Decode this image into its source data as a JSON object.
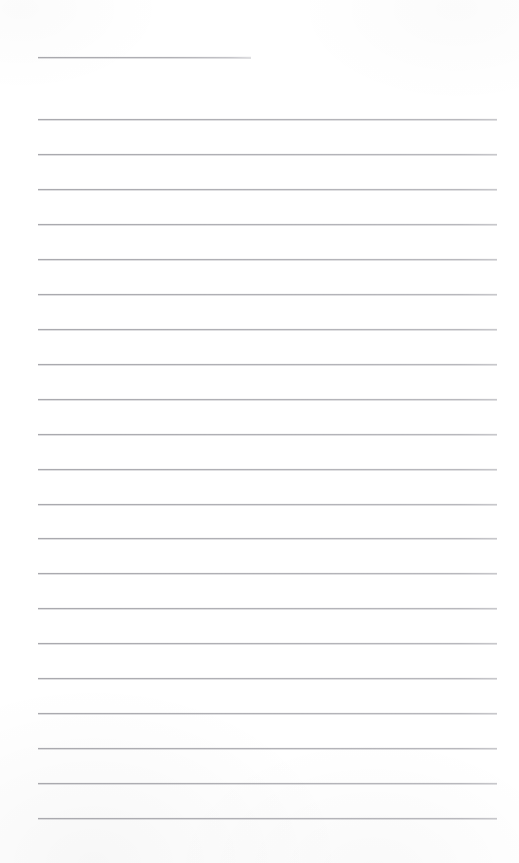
{
  "document": {
    "kind": "scanned-blank-ruled-page",
    "page_label": "",
    "page_width_px": 519,
    "page_height_px": 863,
    "background_color": "#ffffff",
    "rule_color": "#b2b2b6",
    "rule_thickness_px": 1,
    "text_content": [],
    "visible_text": ""
  },
  "layout": {
    "left_margin_px": 38,
    "right_margin_px": 497,
    "first_rule_y_px": 57,
    "body_first_rule_y_px": 119,
    "rule_spacing_px": 34.95,
    "full_rule_count": 21,
    "short_rule_count": 1
  },
  "rules": [
    {
      "name": "rule-heading",
      "y": 57,
      "x1": 38,
      "x2": 251,
      "variant": "short"
    },
    {
      "name": "rule-1",
      "y": 119.0,
      "x1": 38,
      "x2": 497,
      "variant": "full"
    },
    {
      "name": "rule-2",
      "y": 154.0,
      "x1": 38,
      "x2": 497,
      "variant": "full"
    },
    {
      "name": "rule-3",
      "y": 188.9,
      "x1": 38,
      "x2": 497,
      "variant": "full"
    },
    {
      "name": "rule-4",
      "y": 223.9,
      "x1": 38,
      "x2": 497,
      "variant": "full"
    },
    {
      "name": "rule-5",
      "y": 258.8,
      "x1": 38,
      "x2": 497,
      "variant": "full"
    },
    {
      "name": "rule-6",
      "y": 293.8,
      "x1": 38,
      "x2": 497,
      "variant": "full"
    },
    {
      "name": "rule-7",
      "y": 328.7,
      "x1": 38,
      "x2": 497,
      "variant": "full"
    },
    {
      "name": "rule-8",
      "y": 363.7,
      "x1": 38,
      "x2": 497,
      "variant": "full"
    },
    {
      "name": "rule-9",
      "y": 398.6,
      "x1": 38,
      "x2": 497,
      "variant": "full"
    },
    {
      "name": "rule-10",
      "y": 433.6,
      "x1": 38,
      "x2": 497,
      "variant": "full"
    },
    {
      "name": "rule-11",
      "y": 468.5,
      "x1": 38,
      "x2": 497,
      "variant": "full"
    },
    {
      "name": "rule-12",
      "y": 503.5,
      "x1": 38,
      "x2": 497,
      "variant": "full"
    },
    {
      "name": "rule-13",
      "y": 538.4,
      "x1": 38,
      "x2": 497,
      "variant": "full"
    },
    {
      "name": "rule-14",
      "y": 573.4,
      "x1": 38,
      "x2": 497,
      "variant": "full"
    },
    {
      "name": "rule-15",
      "y": 608.3,
      "x1": 38,
      "x2": 497,
      "variant": "full"
    },
    {
      "name": "rule-16",
      "y": 643.3,
      "x1": 38,
      "x2": 497,
      "variant": "full"
    },
    {
      "name": "rule-17",
      "y": 678.2,
      "x1": 38,
      "x2": 497,
      "variant": "full"
    },
    {
      "name": "rule-18",
      "y": 713.2,
      "x1": 38,
      "x2": 497,
      "variant": "full"
    },
    {
      "name": "rule-19",
      "y": 748.1,
      "x1": 38,
      "x2": 497,
      "variant": "full"
    },
    {
      "name": "rule-20",
      "y": 783.1,
      "x1": 38,
      "x2": 497,
      "variant": "full"
    },
    {
      "name": "rule-21",
      "y": 818.0,
      "x1": 38,
      "x2": 497,
      "variant": "full"
    }
  ]
}
